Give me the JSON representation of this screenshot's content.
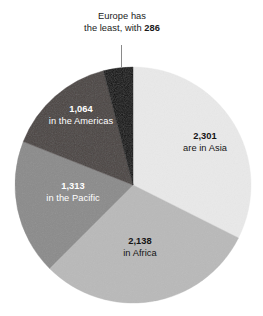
{
  "chart_data": {
    "type": "pie",
    "title": "",
    "subtitle": "",
    "xlabel": "",
    "ylabel": "",
    "grid": false,
    "legend_position": "none",
    "start_angle_deg": 0,
    "direction": "clockwise",
    "total": 7102,
    "categories": [
      "Asia",
      "Africa",
      "the Pacific",
      "the Americas",
      "Europe"
    ],
    "values": [
      2301,
      2138,
      1313,
      1064,
      286
    ],
    "value_labels": [
      "2,301",
      "2,138",
      "1,313",
      "1,064",
      "286"
    ],
    "slices": [
      {
        "name": "asia",
        "value": 2301,
        "value_label": "2,301",
        "description": "are in Asia",
        "color": "#e9e9e9",
        "label_color": "#141414",
        "label_placement": "inside",
        "share_deg": 116.6
      },
      {
        "name": "africa",
        "value": 2138,
        "value_label": "2,138",
        "description": "in Africa",
        "color": "#b9b9b9",
        "label_color": "#141414",
        "label_placement": "inside",
        "share_deg": 108.4
      },
      {
        "name": "pacific",
        "value": 1313,
        "value_label": "1,313",
        "description": "in the Pacific",
        "color": "#8b8b8b",
        "label_color": "#ffffff",
        "label_placement": "inside",
        "share_deg": 66.6
      },
      {
        "name": "americas",
        "value": 1064,
        "value_label": "1,064",
        "description": "in the Americas",
        "color": "#4b4543",
        "label_color": "#ffffff",
        "label_placement": "inside",
        "share_deg": 53.9
      },
      {
        "name": "europe",
        "value": 286,
        "value_label": "286",
        "description": "Europe has the least, with",
        "color": "#0a0a0a",
        "label_color": "#1a1a1a",
        "label_placement": "callout-above",
        "share_deg": 14.5
      }
    ]
  },
  "callout": {
    "line1": "Europe has",
    "line2_prefix": "the least, with ",
    "line2_value": "286",
    "leader_color": "#8a8a8a"
  },
  "labels": {
    "asia": {
      "value": "2,301",
      "desc": "are in Asia"
    },
    "africa": {
      "value": "2,138",
      "desc": "in Africa"
    },
    "pacific": {
      "value": "1,313",
      "desc": "in the Pacific"
    },
    "americas": {
      "value": "1,064",
      "desc": "in the Americas"
    }
  },
  "geometry": {
    "center_x": 133,
    "center_y": 185,
    "radius": 118
  }
}
